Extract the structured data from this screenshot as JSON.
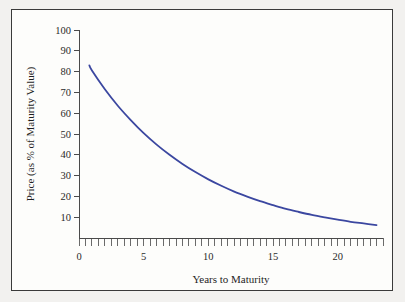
{
  "figure": {
    "background_color": "#fdfdfb",
    "outer_background_color": "#f2f1ef",
    "frame_color": "#3a3a3a"
  },
  "chart_data": {
    "type": "line",
    "title": "",
    "xlabel": "Years to Maturity",
    "ylabel": "Price (as % of Maturity Value)",
    "xlim": [
      0,
      23.5
    ],
    "ylim": [
      0,
      100
    ],
    "grid": false,
    "legend": "none",
    "line_color": "#3b47a0",
    "x_ticks_major": [
      0,
      5,
      10,
      15,
      20
    ],
    "x_tick_labels": [
      "0",
      "5",
      "10",
      "15",
      "20"
    ],
    "x_minor_tick_step": 0.5,
    "y_ticks_major": [
      10,
      20,
      30,
      40,
      50,
      60,
      70,
      80,
      90,
      100
    ],
    "y_tick_labels": [
      "10",
      "20",
      "30",
      "40",
      "50",
      "60",
      "70",
      "80",
      "90",
      "100"
    ],
    "series": [
      {
        "name": "Zero-coupon bond price",
        "x": [
          0.8,
          1,
          2,
          3,
          4,
          5,
          6,
          7,
          8,
          9,
          10,
          11,
          12,
          13,
          14,
          15,
          16,
          17,
          18,
          19,
          20,
          21,
          22,
          23
        ],
        "values": [
          83,
          80.5,
          71.5,
          63.6,
          56.7,
          50.4,
          44.9,
          40.0,
          35.6,
          31.7,
          28.2,
          25.1,
          22.3,
          19.9,
          17.7,
          15.8,
          14.0,
          12.5,
          11.1,
          9.9,
          8.8,
          7.8,
          7.0,
          6.2
        ]
      }
    ]
  },
  "axis_titles": {
    "x": "Years to Maturity",
    "y": "Price (as % of Maturity Value)"
  }
}
